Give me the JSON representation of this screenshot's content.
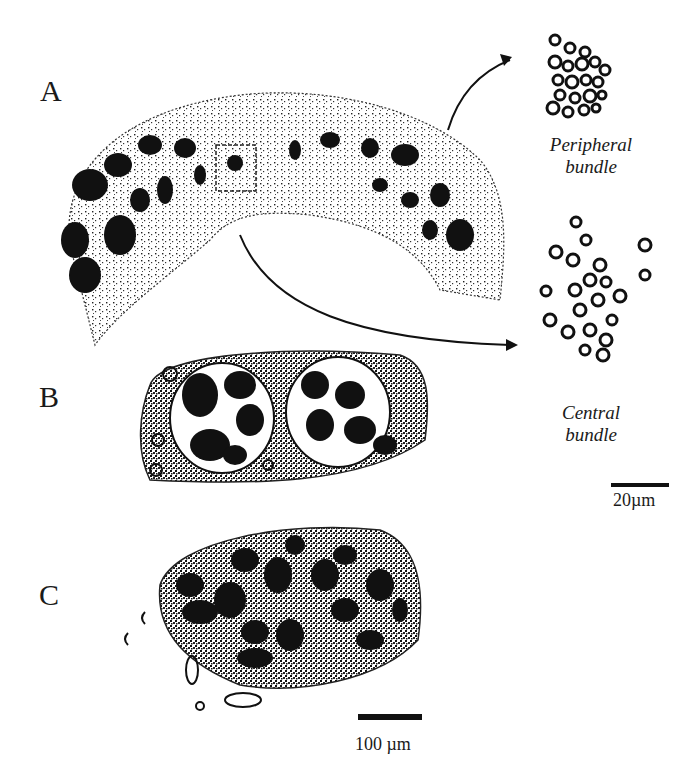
{
  "figure": {
    "panels": [
      {
        "id": "A",
        "label": "A"
      },
      {
        "id": "B",
        "label": "B"
      },
      {
        "id": "C",
        "label": "C"
      }
    ],
    "insets": [
      {
        "id": "peripheral",
        "caption_line1": "Peripheral",
        "caption_line2": "bundle"
      },
      {
        "id": "central",
        "caption_line1": "Central",
        "caption_line2": "bundle"
      }
    ],
    "scale_bars": {
      "inset": {
        "label": "20µm"
      },
      "main": {
        "label": "100 µm"
      }
    }
  }
}
